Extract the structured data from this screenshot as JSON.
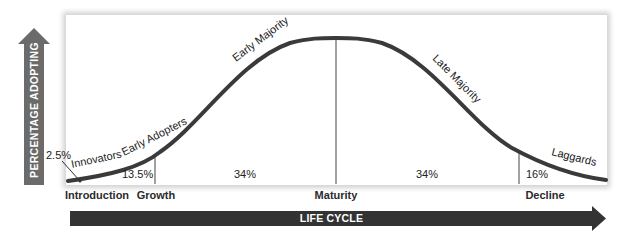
{
  "diagram": {
    "y_axis_label": "PERCENTAGE ADOPTING",
    "x_axis_label": "LIFE CYCLE",
    "segments": [
      {
        "name": "Innovators",
        "percent": "2.5%"
      },
      {
        "name": "Early Adopters",
        "percent": "13.5%"
      },
      {
        "name": "Early Majority",
        "percent": "34%"
      },
      {
        "name": "Late Majority",
        "percent": "34%"
      },
      {
        "name": "Laggards",
        "percent": "16%"
      }
    ],
    "stages": [
      "Introduction",
      "Growth",
      "Maturity",
      "Decline"
    ],
    "colors": {
      "curve": "#3a3a3a",
      "divider": "#8a8a8a",
      "vertical_arrow": "#6b6b6b",
      "horizontal_arrow": "#333333",
      "frame_shadow": "#cccccc"
    }
  }
}
